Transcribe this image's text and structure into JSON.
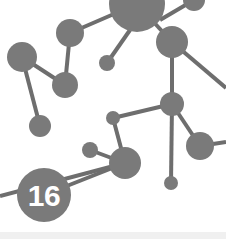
{
  "illustration": {
    "title": "Molecular network graph illustration",
    "background_color": "#ffffff",
    "node_color": "#7a7a7a",
    "edge_color": "#6e6e6e",
    "badge_text_color": "#ffffff",
    "footer_strip_color": "#f0f0f0"
  },
  "badge": {
    "label": "16",
    "cx": 44,
    "cy": 195,
    "r": 27
  },
  "chart_data": {
    "type": "scatter",
    "xlabel": "",
    "ylabel": "",
    "xlim": [
      0,
      226
    ],
    "ylim": [
      0,
      239
    ],
    "grid": false,
    "legend": null,
    "node_color": "#7a7a7a",
    "edge_color": "#6e6e6e",
    "edge_width": 4,
    "nodes": [
      {
        "id": "n1",
        "cx": 137,
        "cy": 4,
        "r": 28,
        "label": ""
      },
      {
        "id": "n2",
        "cx": 194,
        "cy": 0,
        "r": 11,
        "label": ""
      },
      {
        "id": "n3",
        "cx": 70,
        "cy": 33,
        "r": 14,
        "label": ""
      },
      {
        "id": "n4",
        "cx": 172,
        "cy": 42,
        "r": 16,
        "label": ""
      },
      {
        "id": "n5",
        "cx": 22,
        "cy": 57,
        "r": 15,
        "label": ""
      },
      {
        "id": "n6",
        "cx": 107,
        "cy": 63,
        "r": 8,
        "label": ""
      },
      {
        "id": "n7",
        "cx": 65,
        "cy": 85,
        "r": 13,
        "label": ""
      },
      {
        "id": "n8",
        "cx": 172,
        "cy": 104,
        "r": 12,
        "label": ""
      },
      {
        "id": "n9",
        "cx": 40,
        "cy": 126,
        "r": 11,
        "label": ""
      },
      {
        "id": "n10",
        "cx": 113,
        "cy": 118,
        "r": 7,
        "label": ""
      },
      {
        "id": "n11",
        "cx": 200,
        "cy": 146,
        "r": 14,
        "label": ""
      },
      {
        "id": "n12",
        "cx": 90,
        "cy": 150,
        "r": 8,
        "label": ""
      },
      {
        "id": "n13",
        "cx": 125,
        "cy": 163,
        "r": 16,
        "label": ""
      },
      {
        "id": "n14",
        "cx": 171,
        "cy": 183,
        "r": 7,
        "label": ""
      },
      {
        "id": "n15",
        "cx": 44,
        "cy": 195,
        "r": 27,
        "label": "16"
      }
    ],
    "edges": [
      {
        "from": "n3",
        "to": "n1",
        "x1": 70,
        "y1": 33,
        "x2": 137,
        "y2": 4
      },
      {
        "from": "n1",
        "to": "n6",
        "x1": 130,
        "y1": 30,
        "x2": 107,
        "y2": 63
      },
      {
        "from": "n1",
        "to": "n4",
        "x1": 137,
        "y1": 4,
        "x2": 172,
        "y2": 42
      },
      {
        "from": "n4",
        "to": "edge-right-top",
        "x1": 172,
        "y1": 42,
        "x2": 226,
        "y2": 88
      },
      {
        "from": "n4",
        "to": "n8",
        "x1": 172,
        "y1": 42,
        "x2": 172,
        "y2": 104
      },
      {
        "from": "n3",
        "to": "n7",
        "x1": 70,
        "y1": 33,
        "x2": 65,
        "y2": 85
      },
      {
        "from": "n5",
        "to": "n7",
        "x1": 22,
        "y1": 57,
        "x2": 65,
        "y2": 85
      },
      {
        "from": "n5",
        "to": "n9",
        "x1": 22,
        "y1": 57,
        "x2": 40,
        "y2": 126
      },
      {
        "from": "n8",
        "to": "n10",
        "x1": 172,
        "y1": 104,
        "x2": 113,
        "y2": 118
      },
      {
        "from": "n8",
        "to": "n11",
        "x1": 172,
        "y1": 104,
        "x2": 200,
        "y2": 146
      },
      {
        "from": "n8",
        "to": "n14",
        "x1": 172,
        "y1": 104,
        "x2": 171,
        "y2": 183
      },
      {
        "from": "n10",
        "to": "n13",
        "x1": 113,
        "y1": 118,
        "x2": 125,
        "y2": 163
      },
      {
        "from": "n12",
        "to": "n13",
        "x1": 90,
        "y1": 150,
        "x2": 125,
        "y2": 163
      },
      {
        "from": "n13",
        "to": "n15",
        "x1": 125,
        "y1": 163,
        "x2": 44,
        "y2": 195
      },
      {
        "from": "n13",
        "to": "edge-left-bottom",
        "x1": 125,
        "y1": 163,
        "x2": 0,
        "y2": 196
      },
      {
        "from": "n11",
        "to": "edge-right-mid",
        "x1": 200,
        "y1": 146,
        "x2": 226,
        "y2": 142
      },
      {
        "from": "n2",
        "to": "n1",
        "x1": 194,
        "y1": 0,
        "x2": 160,
        "y2": 20
      }
    ]
  }
}
